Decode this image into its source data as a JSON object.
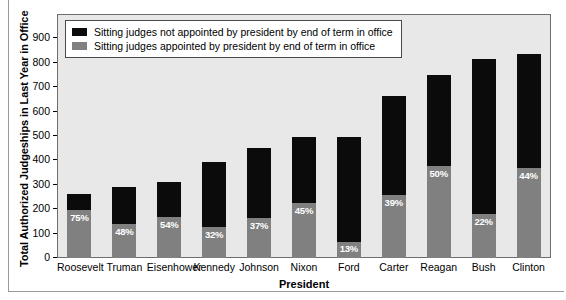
{
  "chart_data": {
    "type": "bar",
    "title": "",
    "subtitle": "",
    "xlabel": "President",
    "ylabel": "Total Authorized Judgeships in Last Year in Office",
    "ylim": [
      0,
      1000
    ],
    "yticks": [
      0,
      100,
      200,
      300,
      400,
      500,
      600,
      700,
      800,
      900
    ],
    "ytick_labels": [
      "0",
      "100",
      "200",
      "300",
      "400",
      "500",
      "600",
      "700",
      "800",
      "900"
    ],
    "grid": false,
    "stacked": true,
    "legend_position": "upper-left-inside",
    "categories": [
      "Roosevelt",
      "Truman",
      "Eisenhower",
      "Kennedy",
      "Johnson",
      "Nixon",
      "Ford",
      "Carter",
      "Reagan",
      "Bush",
      "Clinton"
    ],
    "series": [
      {
        "name": "Sitting judges appointed by president by end of term in office",
        "color": "#808080",
        "values": [
          197,
          140,
          168,
          126,
          166,
          224,
          65,
          259,
          376,
          180,
          369
        ]
      },
      {
        "name": "Sitting judges not appointed by president by end of term in office",
        "color": "#0b0b0b",
        "values": [
          65,
          152,
          144,
          268,
          283,
          273,
          432,
          406,
          376,
          637,
          469
        ]
      }
    ],
    "totals": [
      262,
      292,
      312,
      394,
      449,
      497,
      497,
      665,
      752,
      817,
      838
    ],
    "point_labels": [
      "75%",
      "48%",
      "54%",
      "32%",
      "37%",
      "45%",
      "13%",
      "39%",
      "50%",
      "22%",
      "44%"
    ],
    "annotations": []
  },
  "legend": {
    "items": [
      {
        "label": "Sitting judges not appointed by president by end of term in office",
        "swatch": "black"
      },
      {
        "label": "Sitting judges appointed by president by end of term in office",
        "swatch": "gray"
      }
    ]
  },
  "axes": {
    "y_title": "Total Authorized Judgeships in Last Year in Office",
    "x_title": "President"
  }
}
